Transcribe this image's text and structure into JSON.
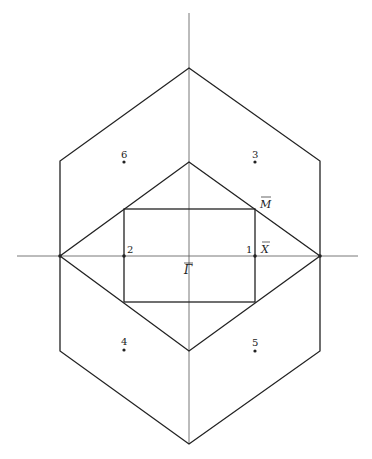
{
  "diagram": {
    "type": "brillouin-zone",
    "colors": {
      "line": "#222222",
      "axis": "#555555",
      "background": "#ffffff"
    },
    "axes": {
      "horizontal": {
        "x1": 17,
        "y1": 256,
        "x2": 358,
        "y2": 256
      },
      "vertical": {
        "x1": 189,
        "y1": 13,
        "x2": 189,
        "y2": 444
      }
    },
    "outer_shape": {
      "points": [
        [
          189,
          68
        ],
        [
          320,
          161
        ],
        [
          320,
          256
        ],
        [
          320,
          351
        ],
        [
          189,
          444
        ],
        [
          60,
          351
        ],
        [
          60,
          256
        ],
        [
          60,
          161
        ]
      ]
    },
    "inner_diamond": {
      "points": [
        [
          189,
          162
        ],
        [
          320,
          256
        ],
        [
          189,
          351
        ],
        [
          60,
          256
        ]
      ]
    },
    "rectangle": {
      "x": 124,
      "y": 209,
      "width": 131,
      "height": 93
    },
    "symmetry_labels": {
      "gamma": "Γ",
      "x_point": "X",
      "m_point": "M"
    },
    "points": [
      {
        "id": "1",
        "label": "1",
        "x": 255,
        "y": 256
      },
      {
        "id": "2",
        "label": "2",
        "x": 124,
        "y": 256
      },
      {
        "id": "3",
        "label": "3",
        "x": 255,
        "y": 162
      },
      {
        "id": "4",
        "label": "4",
        "x": 124,
        "y": 350
      },
      {
        "id": "5",
        "label": "5",
        "x": 255,
        "y": 351
      },
      {
        "id": "6",
        "label": "6",
        "x": 124,
        "y": 162
      }
    ]
  }
}
